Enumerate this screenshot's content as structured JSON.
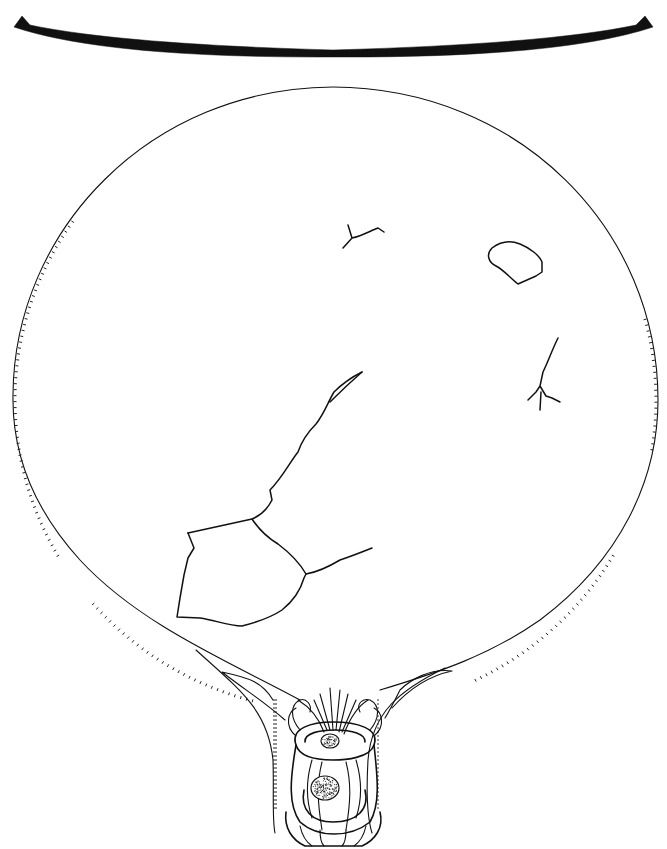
{
  "figure": {
    "title": "Mirror line drawing",
    "colors": {
      "ink": "#111111",
      "paper": "#ffffff"
    }
  },
  "profile": {
    "label": "mirror-disc-section",
    "path": "M14 27 L22 16 L30 25 Q120 44 333 50 Q546 44 636 25 L645 16 L653 27 Q560 58 333 57 Q106 58 14 27 Z"
  },
  "disc": {
    "label": "mirror-disc-outline",
    "path": "M300 700 C230 662 140 625 80 560 C30 505 12 450 13 395 C14 230 150 88 333 87 C520 88 658 230 658 400 C658 480 620 560 540 620 C490 655 440 672 380 690"
  },
  "handle": {
    "label": "handle",
    "left_edge": "M196 650 C240 690 268 710 273 760 C274 790 272 820 275 833",
    "right_edge": "M445 668 C400 690 372 712 368 760 C366 795 368 820 372 833",
    "left_flange": "M222 672 C250 678 262 682 273 700 M222 672 C245 690 262 700 285 720",
    "right_flange": "M452 671 C430 668 410 680 400 690 C395 700 390 710 385 718 M452 671 C428 676 408 690 392 708"
  },
  "ornament": {
    "label": "coiled-animal-ornament",
    "rings": [
      "M296 745 C290 728 312 722 333 722 C356 722 380 728 374 745 C370 758 345 760 333 760 C318 760 300 758 296 745 Z",
      "M305 742 C304 733 320 730 335 730 C352 730 366 734 365 742",
      "M296 745 C290 780 288 805 300 822 C318 838 350 838 370 822 C380 805 378 780 374 745",
      "M304 790 C300 810 312 822 333 822 C356 822 370 810 365 790",
      "M286 812 C284 828 292 840 305 846 L362 846 C375 840 384 828 380 812"
    ],
    "ribs": [
      "M312 760 C306 780 306 800 312 818",
      "M322 762 C316 785 318 805 322 830",
      "M346 762 C352 785 350 805 346 830",
      "M356 760 C362 780 362 800 356 818",
      "M300 826 C302 835 306 842 312 846",
      "M320 830 C320 838 322 844 324 846",
      "M346 830 C346 838 344 844 342 846",
      "M366 826 C364 835 360 842 354 846"
    ],
    "plumes": [
      "M333 730 L330 688",
      "M336 730 L340 690",
      "M339 732 L348 694",
      "M330 730 L320 694",
      "M342 732 L356 700",
      "M327 730 L314 700",
      "M344 734 C350 718 358 706 368 700",
      "M324 732 C318 716 308 706 298 700",
      "M300 730 C290 718 290 705 300 700 C306 698 312 704 310 712",
      "M370 730 C380 718 380 705 370 700 C362 698 356 704 360 712",
      "M296 736 C284 726 288 712 296 708",
      "M374 736 C386 726 382 712 374 708"
    ],
    "granules": [
      {
        "cx": 330,
        "cy": 741,
        "rx": 9,
        "ry": 7
      },
      {
        "cx": 325,
        "cy": 788,
        "rx": 14,
        "ry": 12
      }
    ]
  },
  "cracks": [
    {
      "name": "crack-large-fragment",
      "path": "M188 533 L252 519 C262 515 268 508 272 500 L270 490 C282 478 290 462 298 452 C302 440 308 432 316 424 C324 414 328 402 334 392 C344 382 354 376 362 372"
    },
    {
      "name": "crack-large-fragment-loop",
      "path": "M188 533 L194 548 L188 558 L184 575 L180 598 L177 617 L200 618 C215 620 228 626 242 626 C258 622 270 618 282 610 C292 602 300 592 304 578 L306 574 C298 560 286 550 278 544 C268 538 258 528 252 519"
    },
    {
      "name": "crack-right-branch",
      "path": "M306 574 C318 572 330 566 340 560 C352 556 362 552 372 548"
    },
    {
      "name": "crack-upper-small",
      "path": "M348 225 L352 238 L343 248 M352 238 C362 236 372 230 378 228 L384 232"
    },
    {
      "name": "crack-upper-loop",
      "path": "M492 248 C500 242 510 240 520 244 C530 248 540 256 542 262 L542 272 L536 276 L518 284 C510 278 504 270 496 266 C488 262 486 254 492 248 Z"
    },
    {
      "name": "crack-right-vertical",
      "path": "M558 338 C552 350 548 362 543 372 L540 386 L536 392 L528 400 M540 386 L546 396 L552 398 L560 402 M541 392 L540 410"
    },
    {
      "name": "crack-faint-left",
      "path": "M330 402 C338 394 346 386 362 372"
    }
  ],
  "rim_ticks": {
    "left": {
      "from_deg": 150,
      "to_deg": 215
    },
    "lower_left": {
      "from_deg": 105,
      "to_deg": 140
    },
    "right": {
      "from_deg": 345,
      "to_deg": 370
    },
    "lower_right": {
      "from_deg": 30,
      "to_deg": 65
    }
  }
}
